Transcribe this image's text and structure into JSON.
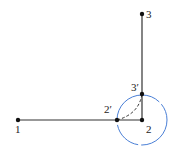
{
  "diagram": {
    "points": [
      {
        "id": "1",
        "label": "1",
        "x": 18,
        "y": 120
      },
      {
        "id": "2",
        "label": "2",
        "x": 142,
        "y": 120
      },
      {
        "id": "3",
        "label": "3",
        "x": 142,
        "y": 14
      },
      {
        "id": "2p",
        "label": "2′",
        "x": 117,
        "y": 120
      },
      {
        "id": "3p",
        "label": "3′",
        "x": 142,
        "y": 94
      }
    ],
    "colors": {
      "line": "#333333",
      "circle": "#4a7fd6",
      "dashed_arc": "#333333"
    },
    "circle": {
      "center": "2",
      "radius": 25
    }
  }
}
